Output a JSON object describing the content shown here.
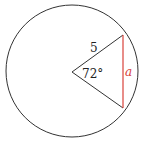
{
  "diagram": {
    "type": "circle-sector-chord",
    "radius_label": "5",
    "angle_label": "72°",
    "chord_label": "a",
    "colors": {
      "stroke": "#333333",
      "chord": "#d9413a",
      "chord_label": "#d9413a"
    }
  }
}
